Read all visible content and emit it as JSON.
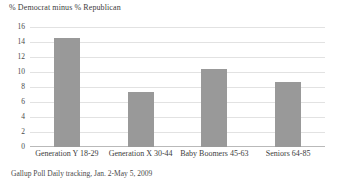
{
  "chart_data": {
    "type": "bar",
    "title": "% Democrat minus % Republican",
    "xlabel": "",
    "ylabel": "",
    "categories": [
      "Generation Y 18-29",
      "Generation X 30-44",
      "Baby Boomers 45-63",
      "Seniors 64-85"
    ],
    "values": [
      14.5,
      7.4,
      10.4,
      8.7
    ],
    "ylim": [
      0,
      16
    ],
    "yticks": [
      0,
      2,
      4,
      6,
      8,
      10,
      12,
      14,
      16
    ],
    "ytick_labels": [
      "0",
      "2",
      "4",
      "6",
      "8",
      "10",
      "12",
      "14",
      "16"
    ],
    "grid": true,
    "legend": false,
    "bar_color": "#999999",
    "gridline_color": "#e2e2e2",
    "axis_color": "#b9b9b9",
    "background_color": "#ffffff",
    "source_note": "Gallup Poll Daily tracking, Jan. 2-May 5, 2009"
  }
}
